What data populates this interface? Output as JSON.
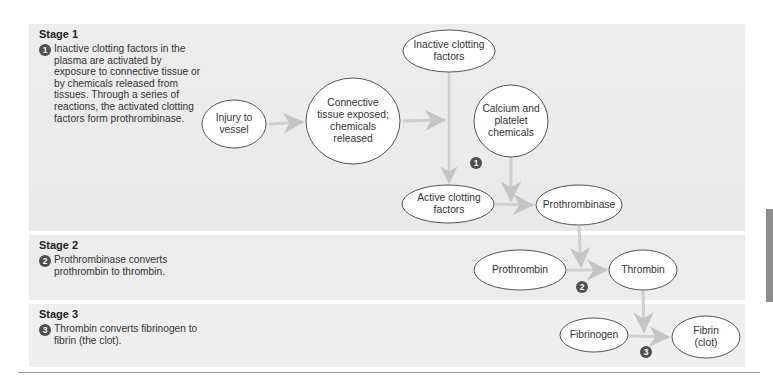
{
  "stages": [
    {
      "title": "Stage 1",
      "badge": "1",
      "description": "Inactive clotting factors in the plasma are activated by exposure to connective tissue or by chemicals released from tissues. Through a series of reactions, the activated clotting factors form prothrombinase."
    },
    {
      "title": "Stage 2",
      "badge": "2",
      "description": "Prothrombinase converts prothrombin to thrombin."
    },
    {
      "title": "Stage 3",
      "badge": "3",
      "description": "Thrombin converts fibrinogen to fibrin (the clot)."
    }
  ],
  "nodes": {
    "injury": "Injury to vessel",
    "connective": "Connective tissue exposed; chemicals released",
    "inactive": "Inactive clotting factors",
    "calcium": "Calcium and platelet chemicals",
    "active": "Active clotting factors",
    "prothrombinase": "Prothrombinase",
    "prothrombin": "Prothrombin",
    "thrombin": "Thrombin",
    "fibrinogen": "Fibrinogen",
    "fibrin": "Fibrin (clot)"
  },
  "diagram_badges": [
    "1",
    "2",
    "3"
  ],
  "colors": {
    "panel_bg": "#ececec",
    "node_fill": "#ffffff",
    "node_stroke": "#555555",
    "arrow": "#c8c8c8",
    "badge": "#4f4f4f"
  }
}
